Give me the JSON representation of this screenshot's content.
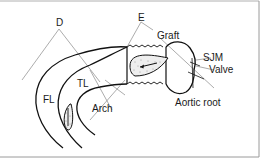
{
  "diagram": {
    "type": "anatomical-schematic",
    "labels": {
      "d": "D",
      "e": "E",
      "graft": "Graft",
      "sjm": "SJM",
      "valve": "Valve",
      "aortic_root": "Aortic root",
      "arch": "Arch",
      "tl": "TL",
      "fl": "FL"
    },
    "colors": {
      "line": "#111111",
      "leader": "#888888",
      "border": "#9a9a9a",
      "background": "#ffffff"
    }
  }
}
